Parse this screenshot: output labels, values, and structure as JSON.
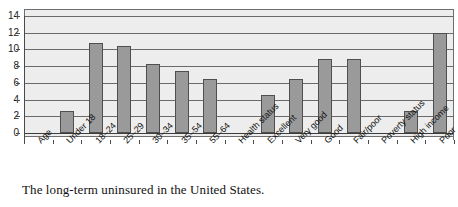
{
  "caption": "The long-term uninsured in the United States.",
  "chart_data": {
    "type": "bar",
    "title": "",
    "subtitle": "",
    "xlabel": "",
    "ylabel": "",
    "ylim": [
      0,
      14
    ],
    "ytick_step": 2,
    "yticks": [
      "14",
      "12",
      "10",
      "8",
      "6",
      "4",
      "2",
      "0"
    ],
    "grid": true,
    "legend": false,
    "legend_position": "none",
    "bar_color": "#9a9a9a",
    "bar_border_color": "#4f4f4f",
    "plot_background": "#ededed",
    "gridline_color": "#6a6a6a",
    "categories": [
      "Age",
      "Under 18",
      "18–24",
      "25–29",
      "30–34",
      "35–54",
      "55–64",
      "Health status",
      "Excellent",
      "Very good",
      "Good",
      "Fair/poor",
      "Poverty status",
      "High income",
      "Poor"
    ],
    "values": [
      null,
      2.6,
      10.8,
      10.4,
      8.3,
      7.4,
      6.5,
      null,
      4.5,
      6.5,
      8.9,
      8.9,
      null,
      2.6,
      12.0
    ],
    "group_headers": [
      "Age",
      "Health status",
      "Poverty status"
    ]
  }
}
